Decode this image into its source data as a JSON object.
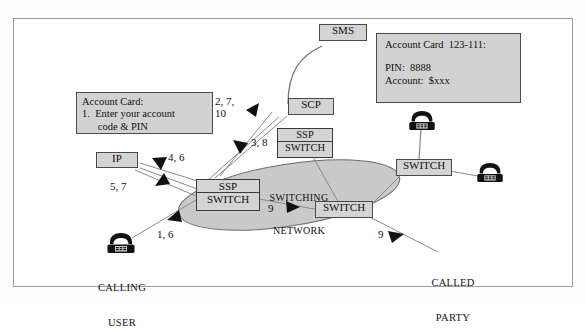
{
  "diagram": {
    "frame": {
      "border_color": "#9a9a9a",
      "background": "#ffffff"
    },
    "palette": {
      "box_fill": "#d4d4d4",
      "box_border": "#3a3a3a",
      "ellipse_fill": "#c9c9c9",
      "ellipse_border": "#6d6d6d",
      "line": "#777777",
      "arrow": "#111111",
      "text": "#111111"
    },
    "cards": {
      "left_account_card": {
        "line1": "Account Card:",
        "line2": "1.  Enter your account",
        "line3": "      code & PIN"
      },
      "right_account_card": {
        "line1": "Account Card  123-111:",
        "line2": "",
        "line3": "PIN:  8888",
        "line4": "Account:  $xxx"
      }
    },
    "nodes": {
      "sms": "SMS",
      "scp": "SCP",
      "ip": "IP",
      "ssp_upper": {
        "top": "SSP",
        "bottom": "SWITCH"
      },
      "ssp_left": {
        "top": "SSP",
        "bottom": "SWITCH"
      },
      "switch_center": "SWITCH",
      "switch_right": "SWITCH"
    },
    "cloud": {
      "line1": "SWITCHING",
      "line2": "NETWORK"
    },
    "endpoints": {
      "calling_user": {
        "line1": "CALLING",
        "line2": "USER",
        "icon": "telephone-icon"
      },
      "called_party": {
        "line1": "CALLED",
        "line2": "PARTY",
        "icon": "telephone-icon"
      },
      "phone_top_right": {
        "icon": "telephone-icon"
      },
      "phone_mid_right": {
        "icon": "telephone-icon"
      }
    },
    "step_labels": {
      "ip_to_ssp": "4, 6",
      "ssp_to_ip": "5, 7",
      "scp_steps": "2, 7,\n10",
      "scp_down": "3, 8",
      "user_to_ssp": "1, 6",
      "network_mid": "9",
      "called_party_step": "9"
    }
  }
}
